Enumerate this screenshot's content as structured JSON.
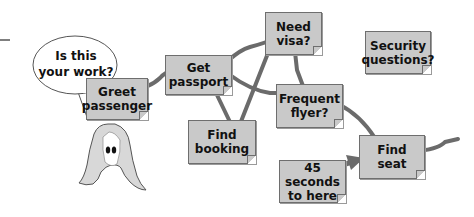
{
  "diagram": {
    "speech_bubble": {
      "text_line1": "Is this",
      "text_line2": "your work?"
    },
    "notes": [
      {
        "id": "greet-passenger",
        "line1": "Greet",
        "line2": "passenger"
      },
      {
        "id": "get-passport",
        "line1": "Get",
        "line2": "passport"
      },
      {
        "id": "need-visa",
        "line1": "Need",
        "line2": "visa?"
      },
      {
        "id": "security-questions",
        "line1": "Security",
        "line2": "questions?"
      },
      {
        "id": "frequent-flyer",
        "line1": "Frequent",
        "line2": "flyer?"
      },
      {
        "id": "find-booking",
        "line1": "Find",
        "line2": "booking"
      },
      {
        "id": "find-seat",
        "line1": "Find",
        "line2": "seat"
      },
      {
        "id": "forty-five-seconds",
        "line1": "45 seconds",
        "line2": "to here"
      }
    ],
    "colors": {
      "note_fill": "#c9c9c9",
      "connector": "#6b6b6b",
      "outline": "#555555"
    }
  }
}
